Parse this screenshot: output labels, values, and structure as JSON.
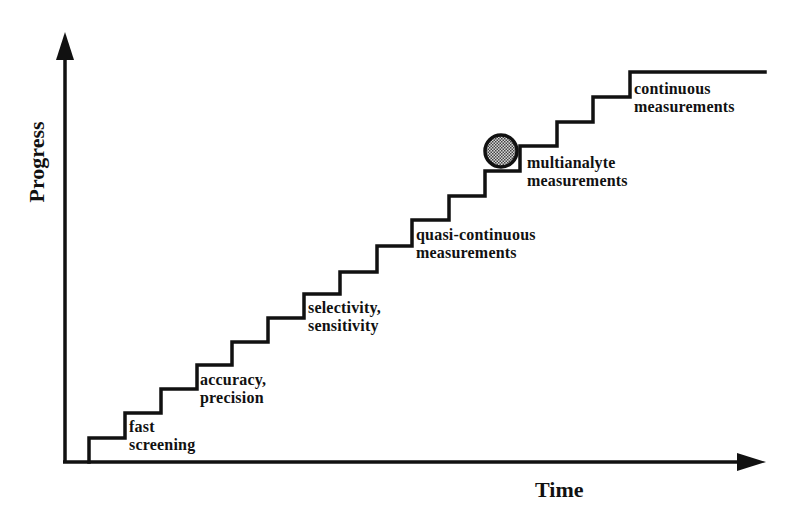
{
  "diagram": {
    "axes": {
      "y_label": "Progress",
      "x_label": "Time"
    },
    "stages": [
      {
        "id": "fast-screening",
        "line1": "fast",
        "line2": "screening"
      },
      {
        "id": "accuracy-precision",
        "line1": "accuracy,",
        "line2": "precision"
      },
      {
        "id": "selectivity-sensitivity",
        "line1": "selectivity,",
        "line2": "sensitivity"
      },
      {
        "id": "quasi-continuous",
        "line1": "quasi-continuous",
        "line2": "measurements"
      },
      {
        "id": "multianalyte",
        "line1": "multianalyte",
        "line2": "measurements"
      },
      {
        "id": "continuous",
        "line1": "continuous",
        "line2": "measurements"
      }
    ],
    "marker": {
      "shape": "circle",
      "fill": "dotted-gray",
      "position": "multianalyte step"
    },
    "colors": {
      "line": "#111111",
      "marker_fill": "#9a9a9a",
      "background": "#ffffff"
    }
  }
}
